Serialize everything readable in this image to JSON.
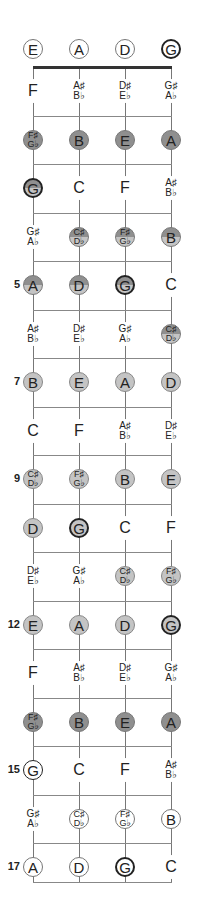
{
  "diagram": {
    "strings": [
      "E",
      "A",
      "D",
      "G"
    ],
    "string_x": [
      33,
      79,
      125,
      171
    ],
    "open_row_y": 49,
    "nut_y": 67,
    "row_spacing": 48.5,
    "bottom_y": 882,
    "colors": {
      "dark": "#8f8f8f",
      "light": "#c4c4c4",
      "line": "#888888",
      "nut": "#333333"
    },
    "open": [
      {
        "top": "E",
        "style": "outline"
      },
      {
        "top": "A",
        "style": "outline"
      },
      {
        "top": "D",
        "style": "outline"
      },
      {
        "top": "G",
        "style": "bold"
      }
    ],
    "frets": [
      {
        "num": "",
        "notes": [
          {
            "top": "F",
            "style": "plain"
          },
          {
            "top": "A♯",
            "bottom": "B♭",
            "style": "plain"
          },
          {
            "top": "D♯",
            "bottom": "E♭",
            "style": "plain"
          },
          {
            "top": "G♯",
            "bottom": "A♭",
            "style": "plain"
          }
        ]
      },
      {
        "num": "",
        "notes": [
          {
            "top": "F♯",
            "bottom": "G♭",
            "style": "dark"
          },
          {
            "top": "B",
            "style": "dark"
          },
          {
            "top": "E",
            "style": "dark"
          },
          {
            "top": "A",
            "style": "dark"
          }
        ]
      },
      {
        "num": "",
        "notes": [
          {
            "top": "G",
            "style": "split-bold"
          },
          {
            "top": "C",
            "style": "plain"
          },
          {
            "top": "F",
            "style": "plain"
          },
          {
            "top": "A♯",
            "bottom": "B♭",
            "style": "plain"
          }
        ]
      },
      {
        "num": "",
        "notes": [
          {
            "top": "G♯",
            "bottom": "A♭",
            "style": "plain"
          },
          {
            "top": "C♯",
            "bottom": "D♭",
            "style": "split"
          },
          {
            "top": "F♯",
            "bottom": "G♭",
            "style": "split"
          },
          {
            "top": "B",
            "style": "split"
          }
        ]
      },
      {
        "num": "5",
        "notes": [
          {
            "top": "A",
            "style": "split"
          },
          {
            "top": "D",
            "style": "split"
          },
          {
            "top": "G",
            "style": "split-bold"
          },
          {
            "top": "C",
            "style": "plain"
          }
        ]
      },
      {
        "num": "",
        "notes": [
          {
            "top": "A♯",
            "bottom": "B♭",
            "style": "plain"
          },
          {
            "top": "D♯",
            "bottom": "E♭",
            "style": "plain"
          },
          {
            "top": "G♯",
            "bottom": "A♭",
            "style": "plain"
          },
          {
            "top": "C♯",
            "bottom": "D♭",
            "style": "split"
          }
        ]
      },
      {
        "num": "7",
        "notes": [
          {
            "top": "B",
            "style": "light"
          },
          {
            "top": "E",
            "style": "light"
          },
          {
            "top": "A",
            "style": "light"
          },
          {
            "top": "D",
            "style": "light"
          }
        ]
      },
      {
        "num": "",
        "notes": [
          {
            "top": "C",
            "style": "plain"
          },
          {
            "top": "F",
            "style": "plain"
          },
          {
            "top": "A♯",
            "bottom": "B♭",
            "style": "plain"
          },
          {
            "top": "D♯",
            "bottom": "E♭",
            "style": "plain"
          }
        ]
      },
      {
        "num": "9",
        "notes": [
          {
            "top": "C♯",
            "bottom": "D♭",
            "style": "light"
          },
          {
            "top": "F♯",
            "bottom": "G♭",
            "style": "light"
          },
          {
            "top": "B",
            "style": "light"
          },
          {
            "top": "E",
            "style": "light"
          }
        ]
      },
      {
        "num": "",
        "notes": [
          {
            "top": "D",
            "style": "light"
          },
          {
            "top": "G",
            "style": "light-bold"
          },
          {
            "top": "C",
            "style": "plain"
          },
          {
            "top": "F",
            "style": "plain"
          }
        ]
      },
      {
        "num": "",
        "notes": [
          {
            "top": "D♯",
            "bottom": "E♭",
            "style": "plain"
          },
          {
            "top": "G♯",
            "bottom": "A♭",
            "style": "plain"
          },
          {
            "top": "C♯",
            "bottom": "D♭",
            "style": "light"
          },
          {
            "top": "F♯",
            "bottom": "G♭",
            "style": "light"
          }
        ]
      },
      {
        "num": "12",
        "notes": [
          {
            "top": "E",
            "style": "light"
          },
          {
            "top": "A",
            "style": "light"
          },
          {
            "top": "D",
            "style": "light"
          },
          {
            "top": "G",
            "style": "light-bold"
          }
        ]
      },
      {
        "num": "",
        "notes": [
          {
            "top": "F",
            "style": "plain"
          },
          {
            "top": "A♯",
            "bottom": "B♭",
            "style": "plain"
          },
          {
            "top": "D♯",
            "bottom": "E♭",
            "style": "plain"
          },
          {
            "top": "G♯",
            "bottom": "A♭",
            "style": "plain"
          }
        ]
      },
      {
        "num": "",
        "notes": [
          {
            "top": "F♯",
            "bottom": "G♭",
            "style": "dark"
          },
          {
            "top": "B",
            "style": "dark"
          },
          {
            "top": "E",
            "style": "dark"
          },
          {
            "top": "A",
            "style": "dark"
          }
        ]
      },
      {
        "num": "15",
        "notes": [
          {
            "top": "G",
            "style": "bold-thin"
          },
          {
            "top": "C",
            "style": "plain"
          },
          {
            "top": "F",
            "style": "plain"
          },
          {
            "top": "A♯",
            "bottom": "B♭",
            "style": "plain"
          }
        ]
      },
      {
        "num": "",
        "notes": [
          {
            "top": "G♯",
            "bottom": "A♭",
            "style": "plain"
          },
          {
            "top": "C♯",
            "bottom": "D♭",
            "style": "outline"
          },
          {
            "top": "F♯",
            "bottom": "G♭",
            "style": "outline"
          },
          {
            "top": "B",
            "style": "outline"
          }
        ]
      },
      {
        "num": "17",
        "notes": [
          {
            "top": "A",
            "style": "outline"
          },
          {
            "top": "D",
            "style": "outline"
          },
          {
            "top": "G",
            "style": "bold"
          },
          {
            "top": "C",
            "style": "plain"
          }
        ]
      }
    ]
  }
}
